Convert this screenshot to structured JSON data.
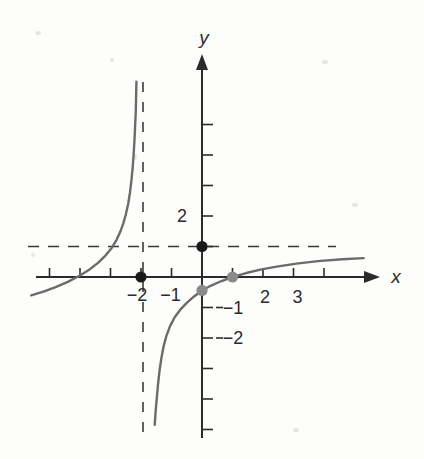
{
  "figure": {
    "title": "",
    "axis_labels": {
      "x": "x",
      "y": "y"
    },
    "x_tick_labels": [
      "−2",
      "−1",
      "2",
      "3"
    ],
    "y_tick_labels": [
      "2",
      "−1",
      "−2"
    ]
  },
  "chart_data": {
    "type": "line",
    "title": "",
    "xlabel": "x",
    "ylabel": "y",
    "xlim": [
      -5.7,
      6.0
    ],
    "ylim": [
      -5.9,
      6.6
    ],
    "grid": false,
    "legend": "none",
    "axis_arrows": [
      "x-positive",
      "y-positive"
    ],
    "x_ticks_major_labeled": [
      -2,
      -1,
      2,
      3
    ],
    "x_ticks_all": [
      -5,
      -4,
      -3,
      -2,
      -1,
      1,
      2,
      3,
      4
    ],
    "y_ticks_all": [
      -5,
      -4,
      -3,
      -2,
      -1,
      1,
      2,
      3,
      4,
      5
    ],
    "y_ticks_labeled": [
      2,
      -1,
      -2
    ],
    "asymptotes": [
      {
        "name": "vertical-asymptote",
        "type": "vertical",
        "value": -2,
        "style": "dashed"
      },
      {
        "name": "horizontal-asymptote",
        "type": "horizontal",
        "value": 1,
        "style": "dashed"
      }
    ],
    "series": [
      {
        "name": "left-branch",
        "color": "#6b6b6b",
        "style": "solid",
        "points": [
          [
            -5.6,
            -0.6
          ],
          [
            -5.2,
            -0.48
          ],
          [
            -4.8,
            -0.33
          ],
          [
            -4.4,
            -0.16
          ],
          [
            -4.0,
            0.05
          ],
          [
            -3.7,
            0.24
          ],
          [
            -3.4,
            0.47
          ],
          [
            -3.15,
            0.72
          ],
          [
            -2.95,
            0.97
          ],
          [
            -2.8,
            1.22
          ],
          [
            -2.68,
            1.48
          ],
          [
            -2.58,
            1.76
          ],
          [
            -2.5,
            2.04
          ],
          [
            -2.42,
            2.4
          ],
          [
            -2.36,
            2.78
          ],
          [
            -2.31,
            3.2
          ],
          [
            -2.27,
            3.62
          ],
          [
            -2.24,
            4.05
          ],
          [
            -2.21,
            4.55
          ],
          [
            -2.19,
            5.0
          ],
          [
            -2.17,
            5.45
          ],
          [
            -2.16,
            5.9
          ],
          [
            -2.15,
            6.4
          ]
        ]
      },
      {
        "name": "right-branch",
        "color": "#6b6b6b",
        "style": "solid",
        "points": [
          [
            -1.55,
            -4.85
          ],
          [
            -1.52,
            -4.4
          ],
          [
            -1.48,
            -3.95
          ],
          [
            -1.44,
            -3.5
          ],
          [
            -1.39,
            -3.05
          ],
          [
            -1.33,
            -2.65
          ],
          [
            -1.26,
            -2.28
          ],
          [
            -1.17,
            -1.94
          ],
          [
            -1.05,
            -1.62
          ],
          [
            -0.9,
            -1.33
          ],
          [
            -0.72,
            -1.08
          ],
          [
            -0.5,
            -0.85
          ],
          [
            -0.25,
            -0.63
          ],
          [
            0.0,
            -0.44
          ],
          [
            0.3,
            -0.28
          ],
          [
            0.62,
            -0.14
          ],
          [
            1.0,
            0.0
          ],
          [
            1.45,
            0.13
          ],
          [
            1.95,
            0.25
          ],
          [
            2.5,
            0.35
          ],
          [
            3.1,
            0.44
          ],
          [
            3.8,
            0.52
          ],
          [
            4.6,
            0.58
          ],
          [
            5.3,
            0.62
          ]
        ]
      }
    ],
    "marked_points": [
      {
        "name": "x-intercept",
        "x": -2,
        "y": 0,
        "color": "#1a1a1a",
        "fill": "solid"
      },
      {
        "name": "y-axis-point",
        "x": 0,
        "y": 1,
        "color": "#1a1a1a",
        "fill": "solid"
      },
      {
        "name": "y-intercept-gray",
        "x": 0,
        "y": -0.44,
        "color": "#8a8a8a",
        "fill": "solid"
      },
      {
        "name": "x-intercept-gray",
        "x": 1,
        "y": 0,
        "color": "#8a8a8a",
        "fill": "solid"
      }
    ]
  }
}
